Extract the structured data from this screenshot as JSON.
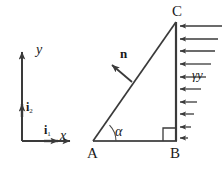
{
  "figure": {
    "kind": "free-body-diagram",
    "stroke_color": "#3a3a3a",
    "text_color": "#1a1a1a",
    "background": "#ffffff"
  },
  "axes": {
    "y_label": "y",
    "x_label": "x",
    "basis_vertical": "i",
    "basis_vertical_sub": "2",
    "basis_horizontal": "i",
    "basis_horizontal_sub": "1",
    "origin_x": 22,
    "origin_y": 141,
    "y_tip_y": 48,
    "x_tip_x": 74
  },
  "triangle": {
    "vertices": [
      {
        "name": "A",
        "x": 93,
        "y": 141
      },
      {
        "name": "B",
        "x": 176,
        "y": 141
      },
      {
        "name": "C",
        "x": 176,
        "y": 22
      }
    ],
    "angle_symbol": "α",
    "right_angle_at": "B"
  },
  "normal": {
    "label": "n",
    "tail_x": 130,
    "tail_y": 80,
    "tip_x": 110,
    "tip_y": 63
  },
  "load": {
    "label": "γy",
    "arrow_count": 10,
    "max_length": 46,
    "min_length": 6,
    "direction": "leftward",
    "top_y": 26,
    "bottom_y": 140
  }
}
